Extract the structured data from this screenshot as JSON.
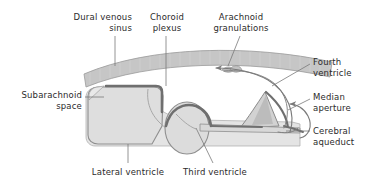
{
  "figure": {
    "background_color": "#ffffff",
    "text_color": "#2b2b2b",
    "line_color": "#6e6e6e",
    "colors": {
      "dural_sinus_fill": "#c3c3c3",
      "dural_sinus_stroke": "#9a9a9a",
      "ventricle_fill": "#dcdcdc",
      "ventricle_stroke": "#8c8c8c",
      "subarachnoid_fill": "#e8e8e8",
      "choroid_plexus": "#6f6f6f",
      "granulation_fill": "#b5b5b5",
      "arrow_color": "#7a7a7a",
      "leader_color": "#7a7a7a"
    }
  },
  "labels": [
    {
      "id": "dural-venous-sinus",
      "name": "label-dural-venous-sinus",
      "text": "Dural venous\nsinus",
      "align": "right",
      "x": 46,
      "y": 12,
      "width": 86
    },
    {
      "id": "choroid-plexus",
      "name": "label-choroid-plexus",
      "text": "Choroid\nplexus",
      "align": "center",
      "x": 137,
      "y": 12,
      "width": 60
    },
    {
      "id": "arachnoid-granulations",
      "name": "label-arachnoid-granulations",
      "text": "Arachnoid\ngranulations",
      "align": "center",
      "x": 203,
      "y": 12,
      "width": 76
    },
    {
      "id": "fourth-ventricle",
      "name": "label-fourth-ventricle",
      "text": "Fourth\nventricle",
      "align": "left",
      "x": 313,
      "y": 57,
      "width": 62
    },
    {
      "id": "median-aperture",
      "name": "label-median-aperture",
      "text": "Median\naperture",
      "align": "left",
      "x": 313,
      "y": 92,
      "width": 62
    },
    {
      "id": "cerebral-aqueduct",
      "name": "label-cerebral-aqueduct",
      "text": "Cerebral\naqueduct",
      "align": "left",
      "x": 313,
      "y": 126,
      "width": 62
    },
    {
      "id": "subarachnoid-space",
      "name": "label-subarachnoid-space",
      "text": "Subarachnoid\nspace",
      "align": "right",
      "x": 6,
      "y": 90,
      "width": 76
    },
    {
      "id": "lateral-ventricle",
      "name": "label-lateral-ventricle",
      "text": "Lateral ventricle",
      "align": "center",
      "x": 88,
      "y": 167,
      "width": 80
    },
    {
      "id": "third-ventricle",
      "name": "label-third-ventricle",
      "text": "Third ventricle",
      "align": "center",
      "x": 178,
      "y": 167,
      "width": 74
    }
  ],
  "structures": [
    {
      "id": "dural-venous-sinus",
      "name": "dural-venous-sinus-band",
      "description": "curved gray band arcing across the top of the cranium"
    },
    {
      "id": "subarachnoid-space",
      "name": "subarachnoid-space-region",
      "description": "light gray space between dura and brain surface"
    },
    {
      "id": "lateral-ventricle",
      "name": "lateral-ventricle-body",
      "description": "large rounded-rectangle chamber at left"
    },
    {
      "id": "third-ventricle",
      "name": "third-ventricle-body",
      "description": "oval chamber at center-bottom"
    },
    {
      "id": "fourth-ventricle",
      "name": "fourth-ventricle-body",
      "description": "triangular chamber at right"
    },
    {
      "id": "cerebral-aqueduct",
      "name": "cerebral-aqueduct-channel",
      "description": "thin horizontal channel joining third and fourth ventricles"
    },
    {
      "id": "median-aperture",
      "name": "median-aperture-opening",
      "description": "opening at the lower right of the fourth ventricle"
    },
    {
      "id": "choroid-plexus",
      "name": "choroid-plexus-lining",
      "description": "dark thick line lining the ventricle roofs"
    },
    {
      "id": "arachnoid-granulations",
      "name": "arachnoid-granulations-tufts",
      "description": "tufts projecting into the dural venous sinus"
    }
  ],
  "flow_arrows": [
    {
      "id": "csf-into-sinus",
      "name": "flow-arrow-into-sinus",
      "direction": "left",
      "description": "CSF absorbed into dural venous sinus"
    },
    {
      "id": "csf-out-median-aperture",
      "name": "flow-arrow-median-aperture",
      "direction": "up",
      "description": "CSF exiting via median aperture into subarachnoid space"
    }
  ]
}
